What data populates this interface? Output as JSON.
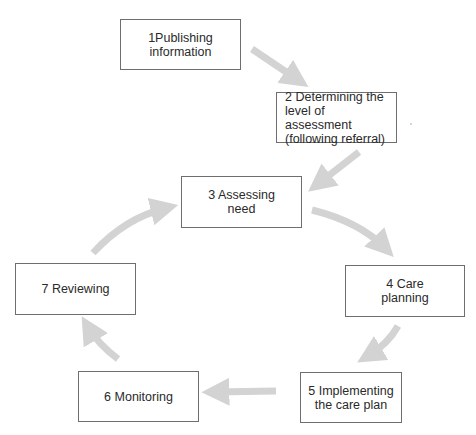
{
  "diagram": {
    "type": "cycle-flow",
    "arrow_color": "#d3d3d3",
    "box_border_color": "#6e6e6e",
    "text_color": "#2a2a2a",
    "steps": [
      {
        "id": 1,
        "label": "1Publishing\ninformation"
      },
      {
        "id": 2,
        "label": "2 Determining the\nlevel of assessment\n(following referral)"
      },
      {
        "id": 3,
        "label": "3 Assessing\nneed"
      },
      {
        "id": 4,
        "label": "4 Care\nplanning"
      },
      {
        "id": 5,
        "label": "5 Implementing\nthe care plan"
      },
      {
        "id": 6,
        "label": "6 Monitoring"
      },
      {
        "id": 7,
        "label": "7 Reviewing"
      }
    ],
    "connections": [
      {
        "from": 1,
        "to": 2
      },
      {
        "from": 2,
        "to": 3
      },
      {
        "from": 3,
        "to": 4
      },
      {
        "from": 4,
        "to": 5
      },
      {
        "from": 5,
        "to": 6
      },
      {
        "from": 6,
        "to": 7
      },
      {
        "from": 7,
        "to": 3
      }
    ]
  }
}
